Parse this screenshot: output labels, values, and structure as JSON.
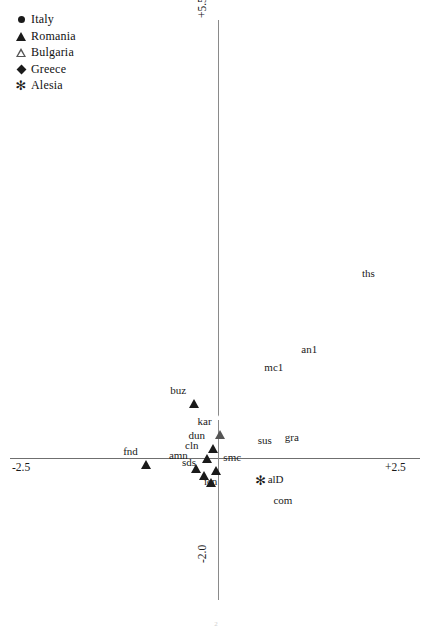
{
  "chart_data": {
    "type": "scatter",
    "title": "",
    "xlabel": "",
    "ylabel": "",
    "xlim": [
      -2.5,
      2.5
    ],
    "ylim": [
      -2.0,
      5.5
    ],
    "grid": false,
    "legend_position": "top-left",
    "axis_ticks": {
      "x_left": "-2.5",
      "x_right": "+2.5",
      "y_top": "+5.5",
      "y_bottom": "-2.0"
    },
    "series": [
      {
        "name": "Italy",
        "marker": "filled-circle",
        "color": "#1a1a1a",
        "points": [
          {
            "label": "an1",
            "x": 0.93,
            "y": 1.4,
            "label_side": "right"
          },
          {
            "label": "sus",
            "x": 0.4,
            "y": 0.22,
            "label_side": "right"
          },
          {
            "label": "gra",
            "x": 0.73,
            "y": 0.26,
            "label_side": "right"
          },
          {
            "label": "com",
            "x": 0.59,
            "y": -0.56,
            "label_side": "right"
          }
        ]
      },
      {
        "name": "Romania",
        "marker": "filled-triangle",
        "color": "#1a1a1a",
        "points": [
          {
            "label": "buz",
            "x": -0.29,
            "y": 0.87,
            "label_side": "left"
          },
          {
            "label": "dun",
            "x": -0.06,
            "y": 0.28,
            "label_side": "left"
          },
          {
            "label": "cln",
            "x": -0.14,
            "y": 0.16,
            "label_side": "left"
          },
          {
            "label": "amn",
            "x": -0.27,
            "y": 0.03,
            "label_side": "left"
          },
          {
            "label": "sds",
            "x": -0.17,
            "y": -0.07,
            "label_side": "left"
          },
          {
            "label": "icn",
            "x": -0.09,
            "y": -0.15,
            "label_side": "below"
          },
          {
            "label": "smc",
            "x": -0.02,
            "y": 0.0,
            "label_side": "right"
          },
          {
            "label": "fnd",
            "x": -0.88,
            "y": 0.08,
            "label_side": "left"
          }
        ]
      },
      {
        "name": "Bulgaria",
        "marker": "open-triangle",
        "color": "#555555",
        "points": [
          {
            "label": "kar",
            "x": 0.02,
            "y": 0.47,
            "label_side": "left"
          }
        ]
      },
      {
        "name": "Greece",
        "marker": "filled-diamond",
        "color": "#1a1a1a",
        "points": [
          {
            "label": "ths",
            "x": 1.67,
            "y": 2.38,
            "label_side": "right"
          },
          {
            "label": "mc1",
            "x": 0.48,
            "y": 1.17,
            "label_side": "right"
          }
        ]
      },
      {
        "name": "Alesia",
        "marker": "asterisk",
        "color": "#1a1a1a",
        "points": [
          {
            "label": "alD",
            "x": 0.52,
            "y": -0.29,
            "label_side": "right"
          }
        ]
      }
    ]
  },
  "legend": {
    "items": [
      {
        "label": "Italy",
        "marker": "filled-circle"
      },
      {
        "label": "Romania",
        "marker": "filled-triangle"
      },
      {
        "label": "Bulgaria",
        "marker": "open-triangle"
      },
      {
        "label": "Greece",
        "marker": "filled-diamond"
      },
      {
        "label": "Alesia",
        "marker": "asterisk"
      }
    ]
  },
  "caption": "2"
}
